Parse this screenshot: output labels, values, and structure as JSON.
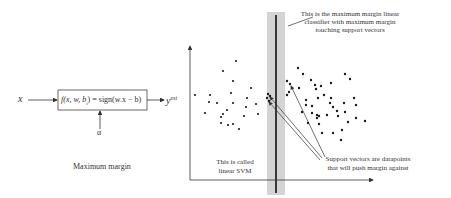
{
  "block_diagram": {
    "input_label": "x",
    "function_label": "f(x, w, b) = sign(w.x − b)",
    "function_parts": {
      "f": "f",
      "args": "(x, w, b",
      "sub": "i",
      "rest": ") = sign(w.x − b)"
    },
    "output_label": "y",
    "output_superscript": "est",
    "parameter_label": "α",
    "caption": "Maximum margin"
  },
  "plot": {
    "annotations": {
      "classifier_note": [
        "This is the maximum margin linear",
        "classifier with maximum margin",
        "touching support vectors"
      ],
      "svm_note": [
        "This is called",
        "linear SVM"
      ],
      "support_vectors_note": [
        "Support vectors are datapoints",
        "that will push margin against"
      ]
    },
    "colors": {
      "margin_band": "#d4d4d4",
      "boundary": "#111111",
      "points": "#1a1a1a",
      "axes": "#333333"
    },
    "left_points": [
      [
        210,
        95
      ],
      [
        223,
        71
      ],
      [
        233,
        81
      ],
      [
        236,
        61
      ],
      [
        231,
        93
      ],
      [
        209,
        102
      ],
      [
        205,
        113
      ],
      [
        195,
        95
      ],
      [
        217,
        103
      ],
      [
        233,
        103
      ],
      [
        227,
        110
      ],
      [
        246,
        107
      ],
      [
        251,
        88
      ],
      [
        247,
        98
      ],
      [
        256,
        104
      ],
      [
        258,
        114
      ],
      [
        223,
        114
      ],
      [
        244,
        116
      ],
      [
        221,
        117
      ],
      [
        221,
        123
      ],
      [
        228,
        125
      ],
      [
        233,
        124
      ],
      [
        239,
        129
      ]
    ],
    "right_points": [
      [
        287,
        95
      ],
      [
        298,
        68
      ],
      [
        303,
        74
      ],
      [
        299,
        88
      ],
      [
        311,
        80
      ],
      [
        315,
        85
      ],
      [
        321,
        86
      ],
      [
        316,
        89
      ],
      [
        306,
        100
      ],
      [
        306,
        105
      ],
      [
        312,
        106
      ],
      [
        302,
        112
      ],
      [
        331,
        83
      ],
      [
        324,
        95
      ],
      [
        331,
        98
      ],
      [
        330,
        103
      ],
      [
        345,
        74
      ],
      [
        350,
        79
      ],
      [
        333,
        107
      ],
      [
        337,
        111
      ],
      [
        338,
        116
      ],
      [
        345,
        112
      ],
      [
        354,
        98
      ],
      [
        356,
        105
      ],
      [
        344,
        103
      ],
      [
        348,
        122
      ],
      [
        327,
        115
      ],
      [
        317,
        115
      ],
      [
        317,
        118
      ],
      [
        356,
        118
      ],
      [
        365,
        121
      ],
      [
        333,
        133
      ],
      [
        342,
        130
      ],
      [
        308,
        123
      ],
      [
        319,
        124
      ],
      [
        341,
        140
      ],
      [
        322,
        133
      ],
      [
        319,
        116
      ],
      [
        312,
        113
      ],
      [
        318,
        98
      ],
      [
        289,
        92
      ]
    ],
    "support_vectors": [
      [
        268,
        94
      ],
      [
        270,
        96
      ],
      [
        267,
        98
      ],
      [
        269,
        101
      ],
      [
        287,
        81
      ],
      [
        290,
        84
      ]
    ]
  }
}
